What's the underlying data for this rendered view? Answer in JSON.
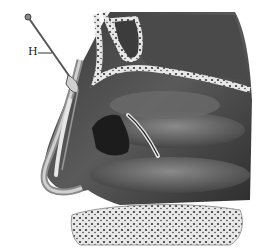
{
  "figure": {
    "labels": [
      {
        "id": "H",
        "text": "H",
        "x": 28,
        "y": 48
      }
    ],
    "colors": {
      "background": "#ffffff",
      "dark_tissue": "#2a2a2a",
      "mid_tissue": "#6e6e6e",
      "light_tissue": "#bdbdbd",
      "bone": "#e6e6e6",
      "probe": "#555555"
    }
  }
}
